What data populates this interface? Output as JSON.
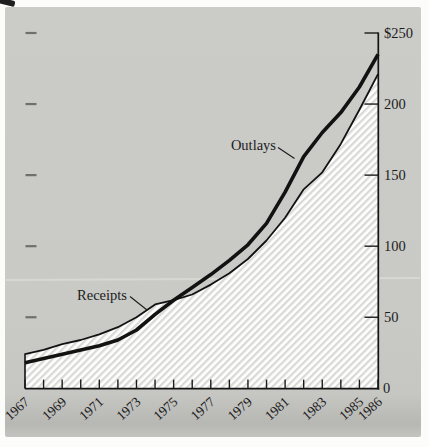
{
  "chart_data": {
    "type": "area",
    "x": [
      1967,
      1968,
      1969,
      1970,
      1971,
      1972,
      1973,
      1974,
      1975,
      1976,
      1977,
      1978,
      1979,
      1980,
      1981,
      1982,
      1983,
      1984,
      1985,
      1986
    ],
    "series": [
      {
        "name": "Outlays",
        "style": "thick-black-line",
        "values": [
          18,
          21,
          24,
          27,
          30,
          34,
          41,
          52,
          62,
          71,
          80,
          90,
          101,
          116,
          138,
          163,
          180,
          194,
          212,
          235
        ]
      },
      {
        "name": "Receipts",
        "style": "thin-black-line-with-hatched-area",
        "values": [
          24,
          27,
          31,
          34,
          38,
          43,
          50,
          59,
          62,
          66,
          73,
          81,
          91,
          104,
          120,
          140,
          152,
          172,
          196,
          221
        ]
      }
    ],
    "x_tick_labels": [
      "1967",
      "1969",
      "1971",
      "1973",
      "1975",
      "1977",
      "1979",
      "1981",
      "1983",
      "1985",
      "1986"
    ],
    "y_ticks": [
      0,
      50,
      100,
      150,
      200,
      250
    ],
    "y_tick_labels": [
      "0",
      "50",
      "100",
      "150",
      "200",
      "$250"
    ],
    "xlim": [
      1967,
      1986
    ],
    "ylim": [
      0,
      250
    ],
    "grid": false,
    "legend_position": "inline-annotations",
    "annotations": [
      {
        "text": "Outlays",
        "points_to": "thick line"
      },
      {
        "text": "Receipts",
        "points_to": "thin line"
      }
    ]
  },
  "colors": {
    "panel_background": "#c9c9c6",
    "line_color": "#121212",
    "hatch_line": "#d9d9d6",
    "hatch_background": "#ffffff",
    "left_tick": "#6f6f6f"
  }
}
